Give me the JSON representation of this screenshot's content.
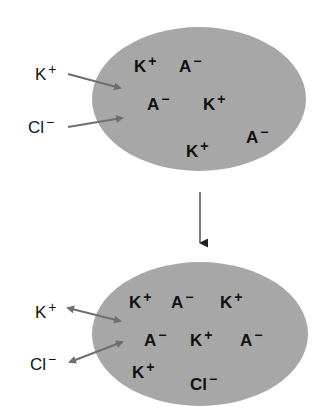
{
  "colors": {
    "cell_fill": "#a7a7a7",
    "arrow": "#6f6f6f",
    "text": "#111111",
    "transition_arrow": "#222222"
  },
  "top_cell": {
    "cx": 199,
    "cy": 99,
    "rx": 107,
    "ry": 72,
    "outside_ions": [
      {
        "symbol": "K",
        "charge": "+",
        "x": 35,
        "y": 80
      },
      {
        "symbol": "Cl",
        "charge": "−",
        "x": 28,
        "y": 133
      }
    ],
    "arrows": [
      {
        "type": "inward",
        "x1": 68,
        "y1": 74,
        "x2": 120,
        "y2": 88
      },
      {
        "type": "inward",
        "x1": 68,
        "y1": 127,
        "x2": 122,
        "y2": 118
      }
    ],
    "inside_ions": [
      {
        "symbol": "K",
        "charge": "+",
        "x": 134,
        "y": 72
      },
      {
        "symbol": "A",
        "charge": "−",
        "x": 179,
        "y": 72
      },
      {
        "symbol": "A",
        "charge": "−",
        "x": 147,
        "y": 110
      },
      {
        "symbol": "K",
        "charge": "+",
        "x": 203,
        "y": 110
      },
      {
        "symbol": "A",
        "charge": "−",
        "x": 246,
        "y": 143
      },
      {
        "symbol": "K",
        "charge": "+",
        "x": 186,
        "y": 157
      }
    ]
  },
  "transition_arrow": {
    "x": 200,
    "y1": 192,
    "y2": 243
  },
  "bottom_cell": {
    "cx": 200,
    "cy": 334,
    "rx": 108,
    "ry": 72,
    "outside_ions": [
      {
        "symbol": "K",
        "charge": "+",
        "x": 35,
        "y": 318
      },
      {
        "symbol": "Cl",
        "charge": "−",
        "x": 30,
        "y": 370
      }
    ],
    "arrows": [
      {
        "type": "bidirectional",
        "x1": 68,
        "y1": 308,
        "x2": 120,
        "y2": 321
      },
      {
        "type": "bidirectional",
        "x1": 70,
        "y1": 362,
        "x2": 122,
        "y2": 342
      }
    ],
    "inside_ions": [
      {
        "symbol": "K",
        "charge": "+",
        "x": 129,
        "y": 308
      },
      {
        "symbol": "A",
        "charge": "−",
        "x": 171,
        "y": 308
      },
      {
        "symbol": "K",
        "charge": "+",
        "x": 220,
        "y": 308
      },
      {
        "symbol": "A",
        "charge": "−",
        "x": 144,
        "y": 346
      },
      {
        "symbol": "K",
        "charge": "+",
        "x": 190,
        "y": 346
      },
      {
        "symbol": "A",
        "charge": "−",
        "x": 240,
        "y": 346
      },
      {
        "symbol": "K",
        "charge": "+",
        "x": 132,
        "y": 378
      },
      {
        "symbol": "Cl",
        "charge": "−",
        "x": 190,
        "y": 390
      }
    ]
  }
}
